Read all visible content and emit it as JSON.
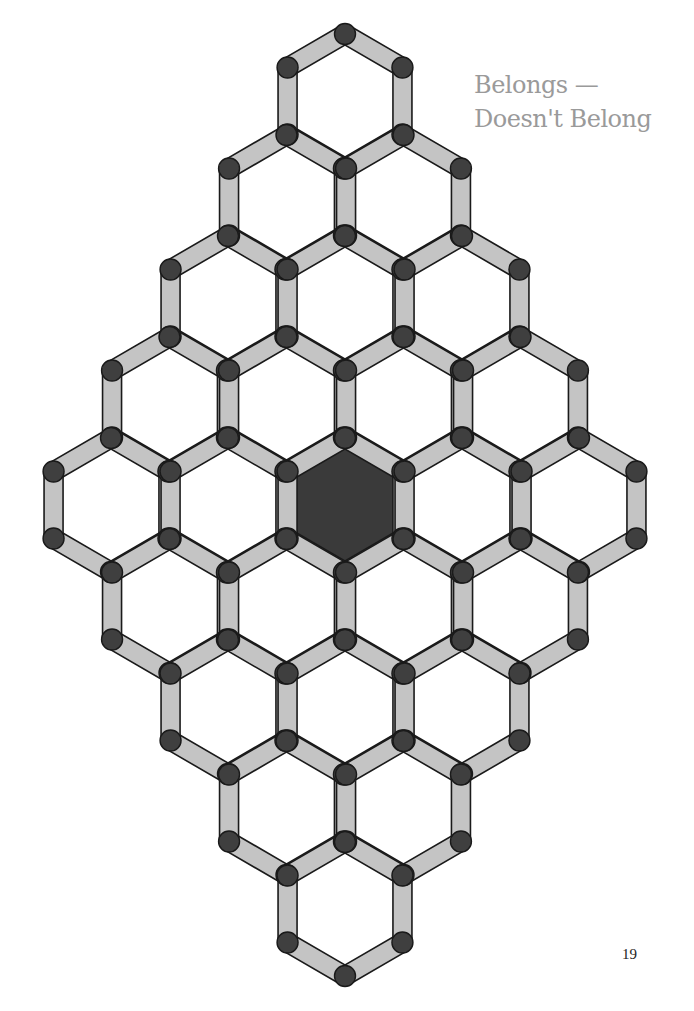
{
  "page": {
    "title_line1": "Belongs —",
    "title_line2": "Doesn't Belong",
    "page_number": "19"
  },
  "board": {
    "shape": "hexagonal-diamond",
    "rows": [
      1,
      2,
      3,
      4,
      5,
      4,
      3,
      2,
      1
    ],
    "center": {
      "x": 345,
      "y": 505
    },
    "hex_spacing_x": 117,
    "hex_spacing_y": 101,
    "hex_radius": 67,
    "highlighted_cell": {
      "row": 4,
      "col": 2
    },
    "colors": {
      "edge_fill": "#c4c4c4",
      "edge_stroke": "#1a1a1a",
      "node_fill": "#3f3f3f",
      "highlight_fill": "#3a3a3a",
      "cell_fill": "#ffffff",
      "title": "#9a9a9a"
    }
  }
}
